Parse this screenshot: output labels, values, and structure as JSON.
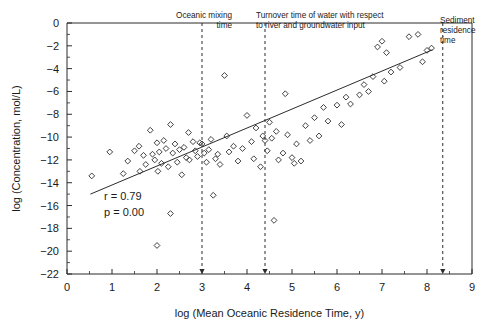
{
  "chart_data": {
    "type": "scatter",
    "title": "",
    "xlabel": "log (Mean Oceanic Residence Time, y)",
    "ylabel": "log (Concentration, mol/L)",
    "xlim": [
      0,
      9
    ],
    "ylim": [
      -22,
      0
    ],
    "xticks": [
      "0",
      "1",
      "2",
      "3",
      "4",
      "5",
      "6",
      "7",
      "8",
      "9"
    ],
    "xtick_values": [
      0,
      1,
      2,
      3,
      4,
      5,
      6,
      7,
      8,
      9
    ],
    "yticks": [
      "0",
      "-2",
      "-4",
      "-6",
      "-8",
      "-10",
      "-12",
      "-14",
      "-16",
      "-18",
      "-20",
      "-22"
    ],
    "ytick_values": [
      0,
      -2,
      -4,
      -6,
      -8,
      -10,
      -12,
      -14,
      -16,
      -18,
      -20,
      -22
    ],
    "xtick_minor_step": 0.5,
    "ytick_minor_step": 1,
    "grid": false,
    "legend": false,
    "marker": "open-diamond",
    "marker_size": 4,
    "series": [
      {
        "name": "elements",
        "points": [
          [
            0.55,
            -13.4
          ],
          [
            0.95,
            -11.3
          ],
          [
            1.25,
            -13.2
          ],
          [
            1.35,
            -12.1
          ],
          [
            1.5,
            -11.2
          ],
          [
            1.6,
            -10.8
          ],
          [
            1.62,
            -13.0
          ],
          [
            1.7,
            -11.6
          ],
          [
            1.75,
            -12.4
          ],
          [
            1.85,
            -9.4
          ],
          [
            1.9,
            -11.5
          ],
          [
            1.95,
            -12.0
          ],
          [
            2.0,
            -10.5
          ],
          [
            2.0,
            -19.5
          ],
          [
            2.02,
            -13.0
          ],
          [
            2.05,
            -11.3
          ],
          [
            2.1,
            -12.3
          ],
          [
            2.15,
            -10.3
          ],
          [
            2.2,
            -11.0
          ],
          [
            2.25,
            -12.6
          ],
          [
            2.3,
            -8.9
          ],
          [
            2.3,
            -16.7
          ],
          [
            2.35,
            -11.4
          ],
          [
            2.4,
            -10.6
          ],
          [
            2.45,
            -12.2
          ],
          [
            2.5,
            -11.1
          ],
          [
            2.55,
            -13.3
          ],
          [
            2.6,
            -10.9
          ],
          [
            2.65,
            -11.8
          ],
          [
            2.7,
            -9.6
          ],
          [
            2.72,
            -12.0
          ],
          [
            2.8,
            -10.4
          ],
          [
            2.85,
            -11.2
          ],
          [
            2.9,
            -11.7
          ],
          [
            2.95,
            -10.5
          ],
          [
            3.0,
            -10.6
          ],
          [
            3.05,
            -11.4
          ],
          [
            3.1,
            -12.2
          ],
          [
            3.15,
            -11.1
          ],
          [
            3.2,
            -10.2
          ],
          [
            3.25,
            -15.1
          ],
          [
            3.3,
            -11.9
          ],
          [
            3.35,
            -11.5
          ],
          [
            3.4,
            -12.4
          ],
          [
            3.5,
            -4.6
          ],
          [
            3.55,
            -9.9
          ],
          [
            3.6,
            -11.3
          ],
          [
            3.7,
            -10.8
          ],
          [
            3.8,
            -12.1
          ],
          [
            3.9,
            -11.0
          ],
          [
            4.0,
            -8.1
          ],
          [
            4.1,
            -10.4
          ],
          [
            4.15,
            -11.9
          ],
          [
            4.2,
            -9.2
          ],
          [
            4.3,
            -12.6
          ],
          [
            4.35,
            -9.9
          ],
          [
            4.4,
            -10.3
          ],
          [
            4.45,
            -11.2
          ],
          [
            4.5,
            -8.7
          ],
          [
            4.55,
            -10.1
          ],
          [
            4.6,
            -17.3
          ],
          [
            4.65,
            -9.5
          ],
          [
            4.7,
            -12.0
          ],
          [
            4.8,
            -11.4
          ],
          [
            4.85,
            -6.2
          ],
          [
            4.9,
            -9.8
          ],
          [
            5.0,
            -11.8
          ],
          [
            5.05,
            -12.3
          ],
          [
            5.1,
            -10.6
          ],
          [
            5.2,
            -12.1
          ],
          [
            5.3,
            -9.0
          ],
          [
            5.4,
            -10.3
          ],
          [
            5.5,
            -8.3
          ],
          [
            5.6,
            -9.9
          ],
          [
            5.7,
            -7.4
          ],
          [
            5.8,
            -8.6
          ],
          [
            6.0,
            -7.2
          ],
          [
            6.1,
            -8.9
          ],
          [
            6.2,
            -6.5
          ],
          [
            6.3,
            -7.1
          ],
          [
            6.5,
            -6.3
          ],
          [
            6.6,
            -5.4
          ],
          [
            6.7,
            -6.0
          ],
          [
            6.8,
            -4.7
          ],
          [
            6.9,
            -2.1
          ],
          [
            7.0,
            -1.6
          ],
          [
            7.05,
            -5.1
          ],
          [
            7.1,
            -2.6
          ],
          [
            7.2,
            -4.3
          ],
          [
            7.4,
            -3.9
          ],
          [
            7.6,
            -1.2
          ],
          [
            7.8,
            -1.0
          ],
          [
            7.9,
            -3.4
          ],
          [
            8.0,
            -2.4
          ],
          [
            8.1,
            -2.2
          ]
        ]
      }
    ],
    "regression_line": {
      "x_start": 0.52,
      "y_start": -15.0,
      "x_end": 8.12,
      "y_end": -2.35
    },
    "statistics": [
      {
        "label": "r = 0.79"
      },
      {
        "label": "p = 0.00"
      }
    ],
    "annotations": [
      {
        "name": "oceanic-mixing-time",
        "x": 3.0,
        "lines": [
          "Oceanic mixing",
          "time"
        ],
        "align": "right",
        "label_x_px": 232,
        "label_y_px": 18
      },
      {
        "name": "turnover-time-water",
        "x": 4.4,
        "lines": [
          "Turnover time of water with respect",
          "to river and groundwater input"
        ],
        "align": "left",
        "label_x_px": 256,
        "label_y_px": 18
      },
      {
        "name": "sediment-residence-time",
        "x": 8.35,
        "lines": [
          "Sediment",
          "residence",
          "time"
        ],
        "align": "left",
        "label_x_px": 440,
        "label_y_px": 23
      }
    ]
  }
}
